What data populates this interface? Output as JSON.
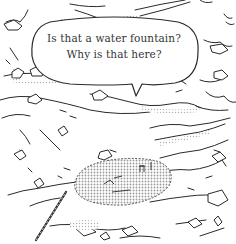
{
  "panel": {
    "speech_bubble": {
      "lines": [
        "Is that a water fountain?",
        "Why is that here?"
      ]
    },
    "colors": {
      "ink": "#2a2a2a",
      "paper": "#ffffff",
      "screentone": "#cfcfcf"
    }
  }
}
